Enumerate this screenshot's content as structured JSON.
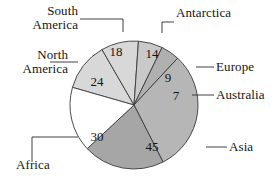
{
  "chart_data": {
    "type": "pie",
    "title": "",
    "subtitle": "",
    "xlabel": "",
    "ylabel": "",
    "legend_position": "none",
    "grid": false,
    "total": 147,
    "categories": [
      "South America",
      "Antarctica",
      "Europe",
      "Australia",
      "Asia",
      "Africa",
      "North America"
    ],
    "values": [
      18,
      14,
      9,
      7,
      45,
      30,
      24
    ],
    "labels": [
      "18",
      "14",
      "9",
      "7",
      "45",
      "30",
      "24"
    ],
    "slices": [
      {
        "name": "South America",
        "value": 18,
        "label": "18",
        "color": "#d8d8d8",
        "start_angle": 286,
        "end_angle": 330,
        "value_x": 116,
        "value_y": 53
      },
      {
        "name": "Antarctica",
        "value": 14,
        "label": "14",
        "color": "#d8d8d8",
        "start_angle": 330,
        "end_angle": 364,
        "value_x": 152,
        "value_y": 55
      },
      {
        "name": "Europe",
        "value": 9,
        "label": "9",
        "color": "#c9c9c9",
        "start_angle": 364,
        "end_angle": 386,
        "value_x": 168,
        "value_y": 79
      },
      {
        "name": "Australia",
        "value": 7,
        "label": "7",
        "color": "#b0b0b0",
        "start_angle": 386,
        "end_angle": 403,
        "value_x": 176,
        "value_y": 97
      },
      {
        "name": "Asia",
        "value": 45,
        "label": "45",
        "color": "#b6b6b6",
        "start_angle": 403,
        "end_angle": 513,
        "value_x": 152,
        "value_y": 148
      },
      {
        "name": "Africa",
        "value": 30,
        "label": "30",
        "color": "#a6a6a6",
        "start_angle": 513,
        "end_angle": 587,
        "value_x": 97,
        "value_y": 138
      },
      {
        "name": "North America",
        "value": 24,
        "label": "24",
        "color": "#ffffff",
        "start_angle": 587,
        "end_angle": 646,
        "value_x": 97,
        "value_y": 83
      }
    ],
    "geometry": {
      "center_x": 134,
      "center_y": 105,
      "radius": 64
    },
    "label_text": {
      "south_america": "South\nAmerica",
      "antarctica": "Antarctica",
      "europe": "Europe",
      "australia": "Australia",
      "asia": "Asia",
      "africa": "Africa",
      "north_america": "North\nAmerica"
    },
    "colors": {
      "outline": "#3a3a3a",
      "leader": "#2b2b2b",
      "text": "#151515",
      "background": "#ffffff"
    }
  }
}
